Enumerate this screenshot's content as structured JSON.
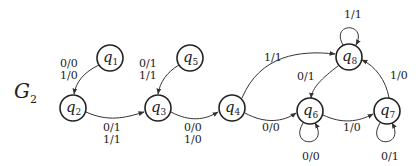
{
  "title": {
    "main": "G",
    "sub": "2"
  },
  "nodes": [
    {
      "id": "q1",
      "base": "q",
      "sub": "1",
      "x": 110,
      "y": 58
    },
    {
      "id": "q2",
      "base": "q",
      "sub": "2",
      "x": 73,
      "y": 108
    },
    {
      "id": "q3",
      "base": "q",
      "sub": "3",
      "x": 158,
      "y": 108
    },
    {
      "id": "q4",
      "base": "q",
      "sub": "4",
      "x": 232,
      "y": 108
    },
    {
      "id": "q5",
      "base": "q",
      "sub": "5",
      "x": 190,
      "y": 58
    },
    {
      "id": "q6",
      "base": "q",
      "sub": "6",
      "x": 310,
      "y": 111
    },
    {
      "id": "q7",
      "base": "q",
      "sub": "7",
      "x": 387,
      "y": 111
    },
    {
      "id": "q8",
      "base": "q",
      "sub": "8",
      "x": 349,
      "y": 57
    }
  ],
  "edges": [
    {
      "from": "q1",
      "to": "q2",
      "label1": "0/0",
      "label2": "1/0"
    },
    {
      "from": "q2",
      "to": "q3",
      "label1": "0/1",
      "label2": "1/1"
    },
    {
      "from": "q5",
      "to": "q3",
      "label1": "0/1",
      "label2": "1/1"
    },
    {
      "from": "q3",
      "to": "q4",
      "label1": "0/0",
      "label2": "1/0"
    },
    {
      "from": "q4",
      "to": "q8",
      "label1": "1/1"
    },
    {
      "from": "q4",
      "to": "q6",
      "label1": "0/0"
    },
    {
      "from": "q8",
      "to": "q6",
      "label1": "0/1"
    },
    {
      "from": "q6",
      "to": "q7",
      "label1": "1/0"
    },
    {
      "from": "q7",
      "to": "q8",
      "label1": "1/0"
    },
    {
      "from": "q8",
      "to": "q8",
      "label1": "1/1"
    },
    {
      "from": "q6",
      "to": "q6",
      "label1": "0/0"
    },
    {
      "from": "q7",
      "to": "q7",
      "label1": "0/1"
    }
  ]
}
